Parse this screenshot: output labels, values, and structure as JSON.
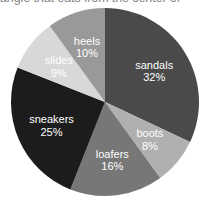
{
  "caption": {
    "clipped_text": "angle that eats from the center of"
  },
  "chart_data": {
    "type": "pie",
    "title": "",
    "xlabel": "",
    "ylabel": "",
    "legend_position": "none",
    "labels_inside_slices": true,
    "start_angle_deg": 0,
    "direction": "clockwise",
    "categories": [
      "sandals",
      "boots",
      "loafers",
      "sneakers",
      "slides",
      "heels"
    ],
    "values": [
      32,
      8,
      16,
      25,
      9,
      10
    ],
    "value_unit": "%",
    "total": 100,
    "slices": [
      {
        "label": "sandals",
        "value": 32,
        "display": "32%",
        "color": "#4a4a4a"
      },
      {
        "label": "boots",
        "value": 8,
        "display": "8%",
        "color": "#b0b0b0"
      },
      {
        "label": "loafers",
        "value": 16,
        "display": "16%",
        "color": "#777777"
      },
      {
        "label": "sneakers",
        "value": 25,
        "display": "25%",
        "color": "#1c1c1c"
      },
      {
        "label": "slides",
        "value": 9,
        "display": "9%",
        "color": "#d8d8d8"
      },
      {
        "label": "heels",
        "value": 10,
        "display": "10%",
        "color": "#999999"
      }
    ],
    "geometry": {
      "center_x": 105,
      "center_y": 102,
      "radius": 94,
      "label_radius_ratio": 0.62
    }
  }
}
